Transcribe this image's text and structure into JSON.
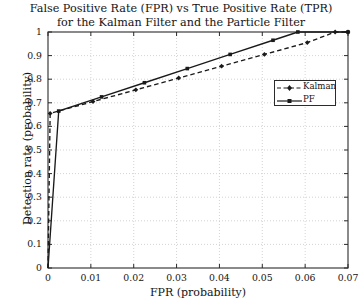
{
  "chart_data": {
    "type": "line",
    "title": "False Positive Rate (FPR) vs True Positive Rate (TPR) for the Kalman Filter and the Particle Filter",
    "title_lines": [
      "False Positive Rate (FPR) vs True Positive Rate (TPR)",
      "for the Kalman Filter and the Particle Filter"
    ],
    "xlabel": "FPR (probability)",
    "ylabel": "Detection rate (probability)",
    "xlim": [
      0,
      0.07
    ],
    "ylim": [
      0,
      1
    ],
    "xticks": [
      0,
      0.01,
      0.02,
      0.03,
      0.04,
      0.05,
      0.06,
      0.07
    ],
    "xticklabels": [
      "0",
      "0.01",
      "0.02",
      "0.03",
      "0.04",
      "0.05",
      "0.06",
      "0.07"
    ],
    "yticks": [
      0,
      0.1,
      0.2,
      0.3,
      0.4,
      0.5,
      0.6,
      0.7,
      0.8,
      0.9,
      1
    ],
    "yticklabels": [
      "0",
      "0.1",
      "0.2",
      "0.3",
      "0.4",
      "0.5",
      "0.6",
      "0.7",
      "0.8",
      "0.9",
      "1"
    ],
    "grid": true,
    "grid_style": "dotted",
    "grid_color": "#c8c8c8",
    "legend_position": "upper right",
    "series": [
      {
        "name": "Kalman",
        "style": "dashed",
        "marker": "diamond",
        "color": "#1a1a1a",
        "x": [
          0.0,
          0.0005,
          0.0105,
          0.0205,
          0.0305,
          0.0405,
          0.0505,
          0.0605,
          0.067,
          0.07
        ],
        "y": [
          0.0,
          0.655,
          0.705,
          0.755,
          0.805,
          0.855,
          0.905,
          0.955,
          1.0,
          1.0
        ]
      },
      {
        "name": "PF",
        "style": "solid",
        "marker": "square",
        "color": "#1a1a1a",
        "x": [
          0.0,
          0.0025,
          0.0125,
          0.0225,
          0.0325,
          0.0425,
          0.0525,
          0.0583,
          0.07
        ],
        "y": [
          0.0,
          0.665,
          0.725,
          0.785,
          0.845,
          0.905,
          0.965,
          1.0,
          1.0
        ]
      }
    ],
    "legend": [
      {
        "label": "Kalman",
        "style": "dashed",
        "marker": "diamond"
      },
      {
        "label": "PF",
        "style": "solid",
        "marker": "square"
      }
    ]
  },
  "axis": {
    "frame_color": "#2b2b2b"
  }
}
